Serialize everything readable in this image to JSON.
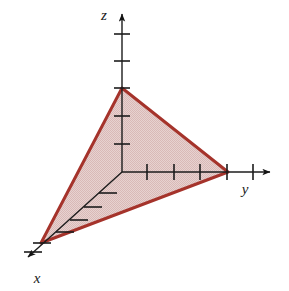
{
  "figure": {
    "canvas": {
      "width": 289,
      "height": 291,
      "background": "#ffffff"
    },
    "origin": {
      "x": 122,
      "y": 172
    },
    "axes": [
      {
        "name": "z",
        "label": "z",
        "label_pos": {
          "x": 104,
          "y": 20
        },
        "direction": "up",
        "start": {
          "x": 122,
          "y": 172
        },
        "end": {
          "x": 122,
          "y": 14
        },
        "arrow_tip": {
          "x": 122,
          "y": 8
        },
        "tick_positions": [
          34,
          61,
          88,
          116,
          144
        ],
        "tick_half_length": 8,
        "color": "#1c1c1c"
      },
      {
        "name": "y",
        "label": "y",
        "label_pos": {
          "x": 245,
          "y": 194
        },
        "direction": "right",
        "start": {
          "x": 122,
          "y": 172
        },
        "end": {
          "x": 270,
          "y": 172
        },
        "arrow_tip": {
          "x": 278,
          "y": 172
        },
        "tick_positions": [
          147,
          174,
          200,
          227,
          253
        ],
        "tick_half_length": 8,
        "color": "#1c1c1c"
      },
      {
        "name": "x",
        "label": "x",
        "label_pos": {
          "x": 31,
          "y": 282
        },
        "direction": "down-left",
        "start": {
          "x": 122,
          "y": 172
        },
        "end": {
          "x": 28,
          "y": 257
        },
        "arrow_tip": {
          "x": 19,
          "y": 265
        },
        "tick_count": 6,
        "tick_half_length": 9,
        "color": "#1c1c1c"
      }
    ],
    "plane": {
      "name": "shaded-triangle",
      "vertices": [
        {
          "axis": "z",
          "x": 122,
          "y": 88
        },
        {
          "axis": "y",
          "x": 228,
          "y": 172
        },
        {
          "axis": "x",
          "x": 41,
          "y": 243
        }
      ],
      "fill_color": "#e2c8c6",
      "stroke_color": "#a5332b",
      "stroke_width": 3,
      "fill_pattern": "dither-checker"
    },
    "colors": {
      "background": "#ffffff",
      "axis": "#1c1c1c",
      "plane_fill": "#e2c8c6",
      "plane_stroke": "#a5332b",
      "label": "#1a1a1a"
    }
  }
}
